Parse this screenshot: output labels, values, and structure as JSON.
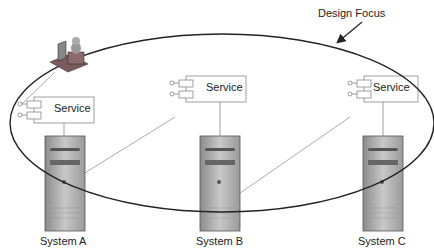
{
  "diagram": {
    "focus_label": "Design Focus",
    "services": [
      {
        "label": "Service",
        "x": 38,
        "y": 98
      },
      {
        "label": "Service",
        "x": 190,
        "y": 77
      },
      {
        "label": "Service",
        "x": 368,
        "y": 77
      }
    ],
    "systems": [
      {
        "label": "System A",
        "x": 43
      },
      {
        "label": "System B",
        "x": 195
      },
      {
        "label": "System C",
        "x": 360
      }
    ]
  }
}
